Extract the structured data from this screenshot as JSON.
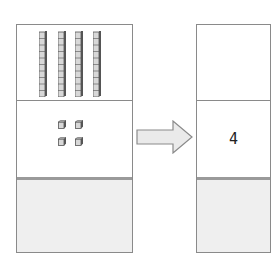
{
  "diagram": {
    "left_panel": {
      "rows": [
        {
          "place": "tens",
          "block": "ten-rod",
          "count": 4,
          "cubes_per_rod": 10
        },
        {
          "place": "ones",
          "block": "unit-cube",
          "count": 4
        },
        {
          "place": "hundreds",
          "block": "none",
          "count": 0,
          "shaded": true
        }
      ]
    },
    "arrow": {
      "direction": "right",
      "fill": "#eaeaea",
      "stroke": "#8a8a8a"
    },
    "right_panel": {
      "rows": [
        {
          "place": "tens",
          "value": ""
        },
        {
          "place": "ones",
          "value": "4"
        },
        {
          "place": "hundreds",
          "value": "",
          "shaded": true
        }
      ]
    },
    "colors": {
      "border": "#8a8a8a",
      "shaded_cell": "#efefef",
      "cube_face": "#d8d8d8",
      "cube_side": "#555555"
    }
  }
}
